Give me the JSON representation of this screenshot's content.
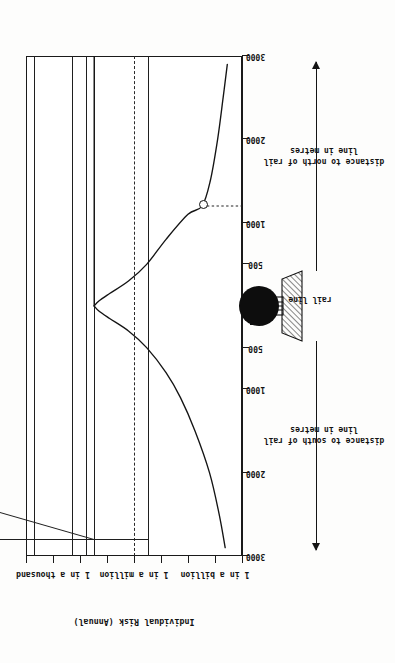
{
  "figure": {
    "orientation": "rotated-90-ccw",
    "y_axis_title": "Individual Risk (Annual)",
    "rail_line_label": "rail line"
  },
  "risk_categories": [
    {
      "label": "Smoking",
      "risk_text": "~5 in 1,000",
      "risk_value": 0.005
    },
    {
      "label": "Motor Vehicle Accidents",
      "risk_text": "~2 in 10,000",
      "risk_value": 0.0002
    },
    {
      "label": "Falls",
      "risk_text": "~6 in 100,000",
      "risk_value": 6e-05
    },
    {
      "label": "Poisoning",
      "risk_text": "~3 in 100,000",
      "risk_value": 3e-05
    },
    {
      "label": "Lightning",
      "risk_text": "~3 in 10,000,000",
      "risk_value": 3e-07
    }
  ],
  "y_ticks": [
    {
      "label": "1 in a thousand",
      "value": 0.001
    },
    {
      "label": "1 in a million",
      "value": 1e-06
    },
    {
      "label": "1 in a billion",
      "value": 1e-09
    }
  ],
  "x_axis": {
    "south": {
      "title_line1": "distance to south of rail",
      "title_line2": "line in metres",
      "ticks": [
        "3000",
        "2000",
        "1000",
        "500"
      ]
    },
    "north": {
      "title_line1": "distance to north of rail",
      "title_line2": "line in metres",
      "ticks": [
        "500",
        "1000",
        "2000",
        "3000"
      ]
    }
  },
  "chart_data": {
    "type": "line",
    "title": "",
    "xlabel": "distance to south of rail line in metres  /  distance to north of rail line in metres",
    "ylabel": "Individual Risk (Annual)",
    "xlim": [
      -3000,
      3000
    ],
    "ylim": [
      1e-10,
      0.01
    ],
    "yscale": "log",
    "grid": false,
    "legend": "none",
    "x_tick_labels": [
      "3000",
      "2000",
      "1000",
      "500",
      "",
      "500",
      "1000",
      "2000",
      "3000"
    ],
    "x_tick_values": [
      -3000,
      -2000,
      -1000,
      -500,
      0,
      500,
      1000,
      2000,
      3000
    ],
    "y_tick_labels": [
      "1 in a thousand",
      "1 in a million",
      "1 in a billion"
    ],
    "y_tick_values": [
      0.001,
      1e-06,
      1e-09
    ],
    "series": [
      {
        "name": "Individual risk vs distance south of rail line",
        "x": [
          0,
          -60,
          -150,
          -300,
          -500,
          -800,
          -1100,
          -1500,
          -2000,
          -2500,
          -2900
        ],
        "y": [
          3e-05,
          2e-05,
          8e-06,
          1.6e-06,
          3.4e-07,
          6.5e-08,
          1.9e-08,
          5.5e-09,
          1.6e-09,
          7e-10,
          4.2e-10
        ]
      },
      {
        "name": "Individual risk vs distance north of rail line",
        "x": [
          0,
          60,
          150,
          300,
          500,
          800,
          1100,
          1200,
          1500,
          2000,
          2500,
          2900
        ],
        "y": [
          3e-05,
          2e-05,
          8e-06,
          1.6e-06,
          3.4e-07,
          6.5e-08,
          1e-08,
          3e-09,
          1.5e-09,
          8e-10,
          5e-10,
          3.5e-10
        ]
      }
    ],
    "annotations": [
      {
        "kind": "marker-with-guide",
        "label": "Lightning risk intersection",
        "x": 1200,
        "y": 3e-09,
        "guide": "horizontal dotted line from marker to right frame edge"
      },
      {
        "kind": "reference-line",
        "label": "rail line",
        "x": 0,
        "style": "solid horizontal line at source"
      },
      {
        "kind": "facility-icon",
        "label": "storage sphere on bunded base",
        "x": 0
      }
    ],
    "reference_lines": [
      {
        "label": "Smoking",
        "y": 0.005,
        "style": "solid"
      },
      {
        "label": "Motor Vehicle Accidents",
        "y": 0.0002,
        "style": "solid"
      },
      {
        "label": "Falls",
        "y": 6e-05,
        "style": "solid"
      },
      {
        "label": "Poisoning",
        "y": 3e-05,
        "style": "solid"
      },
      {
        "label": "1 in a million",
        "y": 1e-06,
        "style": "dash-dot"
      },
      {
        "label": "Lightning",
        "y": 3e-07,
        "style": "solid"
      }
    ]
  }
}
